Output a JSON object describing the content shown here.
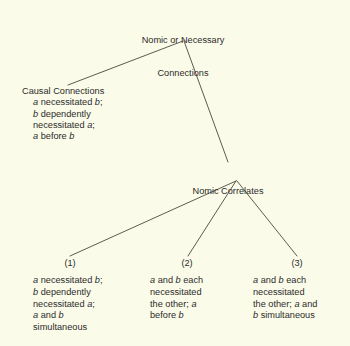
{
  "diagram": {
    "type": "tree",
    "background_color": "#fbfbe9",
    "line_color": "#4a4a3f",
    "root": {
      "label_line1": "Nomic or Necessary",
      "label_line2": "Connections"
    },
    "left_branch": {
      "heading": "Causal Connections",
      "lines": [
        {
          "pre": "",
          "v1": "a",
          "mid": " necessitated ",
          "v2": "b",
          "post": ";"
        },
        {
          "pre": "",
          "v1": "b",
          "mid": " dependently",
          "v2": "",
          "post": ""
        },
        {
          "pre": "necessitated ",
          "v1": "a",
          "mid": ";",
          "v2": "",
          "post": ""
        },
        {
          "pre": "",
          "v1": "a",
          "mid": " before ",
          "v2": "b",
          "post": ""
        }
      ]
    },
    "middle_node": {
      "label": "Nomic Correlates"
    },
    "leaves": [
      {
        "number": "(1)",
        "lines": [
          {
            "pre": "",
            "v1": "a",
            "mid": " necessitated ",
            "v2": "b",
            "post": ";"
          },
          {
            "pre": "",
            "v1": "b",
            "mid": " dependently",
            "v2": "",
            "post": ""
          },
          {
            "pre": "necessitated ",
            "v1": "a",
            "mid": ";",
            "v2": "",
            "post": ""
          },
          {
            "pre": "",
            "v1": "a",
            "mid": " and ",
            "v2": "b",
            "post": ""
          },
          {
            "pre": "simultaneous",
            "v1": "",
            "mid": "",
            "v2": "",
            "post": ""
          }
        ]
      },
      {
        "number": "(2)",
        "lines": [
          {
            "pre": "",
            "v1": "a",
            "mid": " and ",
            "v2": "b",
            "post": " each"
          },
          {
            "pre": "necessitated",
            "v1": "",
            "mid": "",
            "v2": "",
            "post": ""
          },
          {
            "pre": "the other; ",
            "v1": "a",
            "mid": "",
            "v2": "",
            "post": ""
          },
          {
            "pre": "before ",
            "v1": "b",
            "mid": "",
            "v2": "",
            "post": ""
          }
        ]
      },
      {
        "number": "(3)",
        "lines": [
          {
            "pre": "",
            "v1": "a",
            "mid": " and ",
            "v2": "b",
            "post": " each"
          },
          {
            "pre": "necessitated",
            "v1": "",
            "mid": "",
            "v2": "",
            "post": ""
          },
          {
            "pre": "the other; ",
            "v1": "a",
            "mid": " and",
            "v2": "",
            "post": ""
          },
          {
            "pre": "",
            "v1": "b",
            "mid": " simultaneous",
            "v2": "",
            "post": ""
          }
        ]
      }
    ]
  }
}
